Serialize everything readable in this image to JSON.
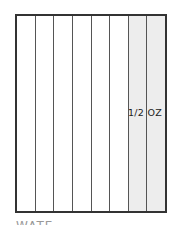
{
  "diagram": {
    "columns": [
      {
        "index": 1,
        "shaded": false
      },
      {
        "index": 2,
        "shaded": false
      },
      {
        "index": 3,
        "shaded": false
      },
      {
        "index": 4,
        "shaded": false
      },
      {
        "index": 5,
        "shaded": false
      },
      {
        "index": 6,
        "shaded": false
      },
      {
        "index": 7,
        "shaded": true
      },
      {
        "index": 8,
        "shaded": true
      }
    ],
    "shaded_label": "1/2 OZ",
    "bottom_text": "WATE",
    "colors": {
      "border": "#333333",
      "divider": "#555555",
      "shade": "#ededed"
    }
  }
}
